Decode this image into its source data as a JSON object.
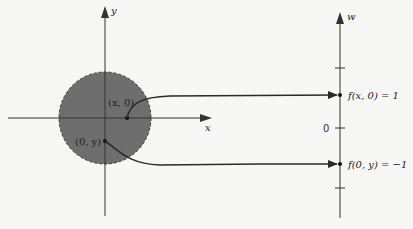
{
  "diagram": {
    "domain_plane": {
      "x_axis_label": "x",
      "y_axis_label": "y",
      "disk_fill": "#6e6e6e",
      "disk_border": "dashed",
      "points": [
        {
          "label": "(x, 0)"
        },
        {
          "label": "(0, y)"
        }
      ]
    },
    "range_line": {
      "axis_label": "w",
      "zero_label": "0",
      "mapped_values": [
        {
          "label": "f(x, 0) = 1"
        },
        {
          "label": "f(0, y) = −1"
        }
      ]
    },
    "colors": {
      "axis": "#333333",
      "disk": "#6e6e6e",
      "arrow": "#2a2a2a",
      "background": "#f7f7f5"
    }
  }
}
